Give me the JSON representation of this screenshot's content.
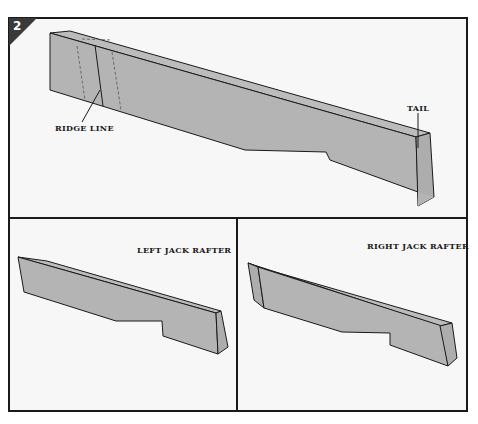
{
  "figure": {
    "step_number": "2",
    "colors": {
      "rafter_fill": "#b4b4b4",
      "rafter_top": "#bcbcbc",
      "outline": "#1a1a1a",
      "background": "#f7f7f7",
      "badge": "#3a3a3a"
    },
    "top_panel": {
      "labels": {
        "ridge_line": "RIDGE LINE",
        "tail": "TAIL"
      }
    },
    "bottom_left_panel": {
      "title": "LEFT JACK RAFTER"
    },
    "bottom_right_panel": {
      "title": "RIGHT JACK RAFTER"
    }
  }
}
